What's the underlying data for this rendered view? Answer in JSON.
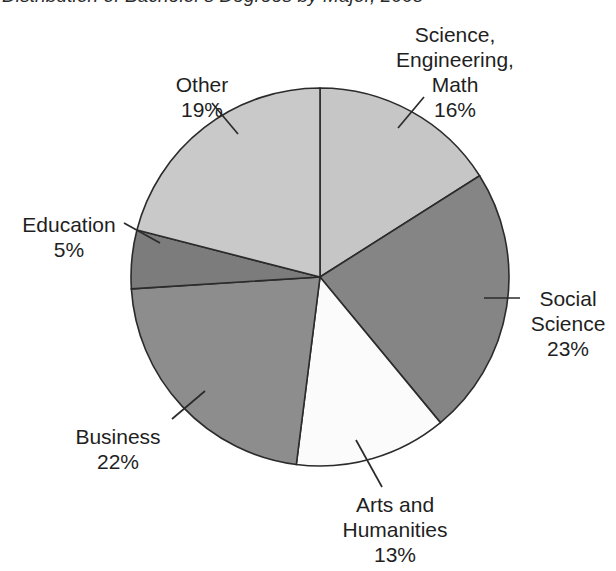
{
  "title": {
    "text": "Distribution of Bachelor's Degrees by Major, 2008",
    "clipped": "true"
  },
  "chart_data": {
    "type": "pie",
    "title": "Distribution of Bachelor's Degrees by Major, 2008",
    "xlabel": "",
    "ylabel": "",
    "legend_position": "none",
    "grid": "off",
    "units": "percent",
    "start_angle_deg": 0,
    "direction": "clockwise",
    "total": 98,
    "categories": [
      "Science, Engineering, Math",
      "Social Science",
      "Arts and Humanities",
      "Business",
      "Education",
      "Other"
    ],
    "values": [
      16,
      23,
      13,
      22,
      5,
      19
    ],
    "slices": [
      {
        "label": "Science,\nEngineering,\nMath",
        "name": "Science, Engineering, Math",
        "line1": "Science,",
        "line2": "Engineering,",
        "line3": "Math",
        "value": 16,
        "percent": "16%",
        "color": "#c6c6c6",
        "start_deg": 0,
        "end_deg": 57.6
      },
      {
        "label": "Social Science",
        "name": "Social Science",
        "line1": "Social",
        "line2": "Science",
        "value": 23,
        "percent": "23%",
        "color": "#858585",
        "start_deg": 57.6,
        "end_deg": 140.4
      },
      {
        "label": "Arts and Humanities",
        "name": "Arts and Humanities",
        "line1": "Arts and",
        "line2": "Humanities",
        "value": 13,
        "percent": "13%",
        "color": "#fbfbfb",
        "start_deg": 140.4,
        "end_deg": 187.2
      },
      {
        "label": "Business",
        "name": "Business",
        "line1": "Business",
        "value": 22,
        "percent": "22%",
        "color": "#8d8d8d",
        "start_deg": 187.2,
        "end_deg": 266.4
      },
      {
        "label": "Education",
        "name": "Education",
        "line1": "Education",
        "value": 5,
        "percent": "5%",
        "color": "#7c7c7c",
        "start_deg": 266.4,
        "end_deg": 284.4
      },
      {
        "label": "Other",
        "name": "Other",
        "line1": "Other",
        "value": 19,
        "percent": "19%",
        "color": "#c9c9c9",
        "start_deg": 284.4,
        "end_deg": 360
      }
    ],
    "geometry": {
      "center_x": 320,
      "center_y": 277,
      "radius": 189
    },
    "colors": {
      "outline": "#2b2b2b",
      "background": "#ffffff",
      "text": "#1f1f1f"
    }
  }
}
